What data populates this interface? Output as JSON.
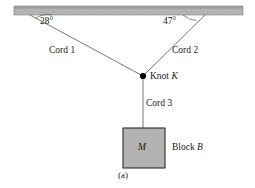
{
  "figure": {
    "caption": "(a)",
    "ceiling": {
      "name": "ceiling-bar",
      "fill_color": "#b3b3b3",
      "edge_color": "#8c8c8c",
      "top_stripe_color": "#9a9a9a"
    },
    "angles": [
      {
        "id": "left",
        "label": "28°",
        "value": 28,
        "unit": "degrees"
      },
      {
        "id": "right",
        "label": "47°",
        "value": 47,
        "unit": "degrees"
      }
    ],
    "cords": [
      {
        "id": "cord1",
        "label": "Cord 1"
      },
      {
        "id": "cord2",
        "label": "Cord 2"
      },
      {
        "id": "cord3",
        "label": "Cord 3"
      }
    ],
    "knot": {
      "label_text": "Knot ",
      "label_symbol": "K",
      "dot_color": "#000000"
    },
    "block": {
      "mass_symbol": "M",
      "label_text": "Block ",
      "label_symbol": "B",
      "fill_color": "#b3b3b3",
      "edge_color": "#1a1a1a"
    },
    "line_color": "#555555"
  }
}
